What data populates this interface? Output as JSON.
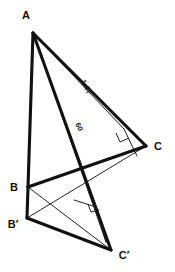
{
  "figure": {
    "background_color": "#ffffff",
    "stroke_color": "#111111",
    "thick_stroke_width": 3.1,
    "thin_stroke_width": 0.9
  },
  "vertices": {
    "A": {
      "label": "A",
      "x": 33,
      "y": 33,
      "label_x": 26,
      "label_y": 19
    },
    "B": {
      "label": "B",
      "x": 28,
      "y": 187,
      "label_x": 14,
      "label_y": 191
    },
    "C": {
      "label": "C",
      "x": 146,
      "y": 146,
      "label_x": 155,
      "label_y": 150
    },
    "Bp": {
      "label": "B′",
      "x": 27,
      "y": 218,
      "label_x": 9,
      "label_y": 228
    },
    "Cp": {
      "label": "C′",
      "x": 111,
      "y": 250,
      "label_x": 119,
      "label_y": 259
    }
  },
  "measurements": [
    {
      "id": "cevian-upper",
      "text": "1.47",
      "from": "A",
      "to": "foot-upper",
      "label_x": 84,
      "label_y": 88,
      "rotation_deg": 62
    },
    {
      "id": "cevian-lower",
      "text": "60",
      "from": "A",
      "to": "foot-lower",
      "label_x": 77,
      "label_y": 128,
      "rotation_deg": 62
    }
  ],
  "feet": {
    "foot_upper": {
      "x": 124,
      "y": 129
    },
    "foot_lower": {
      "x": 106,
      "y": 173
    },
    "foot_prime": {
      "x": 96,
      "y": 207
    },
    "foot_prime_end": {
      "x": 106,
      "y": 242
    }
  },
  "right_angle_marks": [
    {
      "id": "right-angle-upper",
      "x": 124,
      "y": 129
    },
    {
      "id": "right-angle-lower",
      "x": 96,
      "y": 207
    }
  ],
  "segments": [
    {
      "id": "seg-AB",
      "from": "A",
      "to": "B",
      "weight": "thick"
    },
    {
      "id": "seg-AC",
      "from": "A",
      "to": "C",
      "weight": "thick"
    },
    {
      "id": "seg-BC",
      "from": "B",
      "to": "C",
      "weight": "thick"
    },
    {
      "id": "seg-ACp",
      "from": "A",
      "to": "Cp",
      "weight": "thick"
    },
    {
      "id": "seg-BBp",
      "from": "B",
      "to": "Bp",
      "weight": "thick"
    },
    {
      "id": "seg-BpCp",
      "from": "Bp",
      "to": "Cp",
      "weight": "thick"
    },
    {
      "id": "seg-BCp",
      "from": "B",
      "to": "Cp",
      "weight": "thin"
    },
    {
      "id": "seg-BpC",
      "from": "Bp",
      "to": "C",
      "weight": "thin"
    }
  ]
}
